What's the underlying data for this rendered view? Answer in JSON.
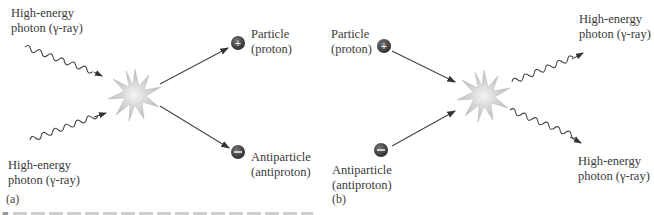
{
  "panel_a": {
    "tag": "(a)",
    "photon_in_top": {
      "line1": "High-energy",
      "line2": "photon (γ-ray)"
    },
    "photon_in_bottom": {
      "line1": "High-energy",
      "line2": "photon (γ-ray)"
    },
    "particle_out": {
      "line1": "Particle",
      "line2": "(proton)",
      "sign": "+"
    },
    "antiparticle_out": {
      "line1": "Antiparticle",
      "line2": "(antiproton)",
      "sign": "−"
    }
  },
  "panel_b": {
    "tag": "(b)",
    "particle_in": {
      "line1": "Particle",
      "line2": "(proton)",
      "sign": "+"
    },
    "antiparticle_in": {
      "line1": "Antiparticle",
      "line2": "(antiproton)",
      "sign": "−"
    },
    "photon_out_top": {
      "line1": "High-energy",
      "line2": "photon (γ-ray)"
    },
    "photon_out_bottom": {
      "line1": "High-energy",
      "line2": "photon (γ-ray)"
    }
  },
  "caption": {
    "marker": "■"
  },
  "colors": {
    "ink": "#3a3a3a",
    "particle": "#444444",
    "starburst": "#cfcfcf"
  }
}
